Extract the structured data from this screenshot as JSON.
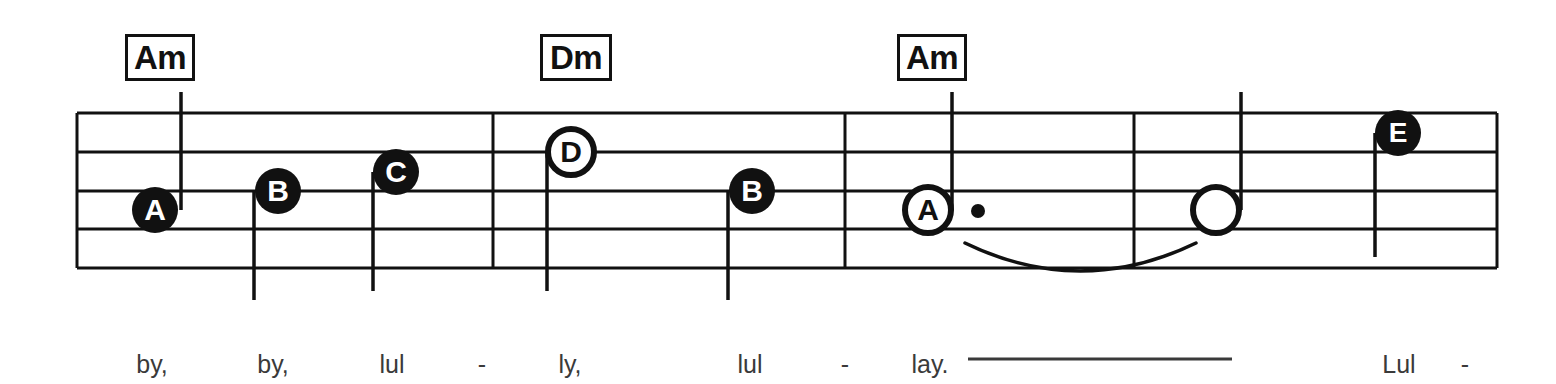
{
  "document": {
    "kind": "sheet-music-staff-line",
    "title": "Lullaby staff system with chord symbols and lyrics"
  },
  "colors": {
    "ink": "#111111",
    "paper": "#ffffff",
    "lyric_text": "#3a3a3a",
    "notehead_fill": "#111111",
    "notehead_hollow": "#ffffff"
  },
  "staff": {
    "x_start": 77,
    "x_end": 1497,
    "line_ys": [
      113,
      152,
      191,
      229,
      268
    ],
    "line_width": 3,
    "barline_xs": [
      493,
      845,
      1134
    ]
  },
  "chords": [
    {
      "label": "Am",
      "x": 160,
      "y": 34,
      "width": 70,
      "height": 47
    },
    {
      "label": "Dm",
      "x": 576,
      "y": 34,
      "width": 72,
      "height": 47
    },
    {
      "label": "Am",
      "x": 932,
      "y": 34,
      "width": 70,
      "height": 47
    }
  ],
  "notes": [
    {
      "letter": "A",
      "x": 155,
      "y": 210,
      "head": "filled",
      "stem": "up",
      "stem_x": 181,
      "stem_y2": 92,
      "dotted": false,
      "radius": 23,
      "font_size": 30
    },
    {
      "letter": "B",
      "x": 278,
      "y": 191,
      "head": "filled",
      "stem": "down",
      "stem_x": 254,
      "stem_y2": 300,
      "dotted": false,
      "radius": 23,
      "font_size": 30
    },
    {
      "letter": "C",
      "x": 396,
      "y": 172,
      "head": "filled",
      "stem": "down",
      "stem_x": 373,
      "stem_y2": 291,
      "dotted": false,
      "radius": 23,
      "font_size": 30
    },
    {
      "letter": "D",
      "x": 571,
      "y": 152,
      "head": "hollow",
      "stem": "down",
      "stem_x": 547,
      "stem_y2": 291,
      "dotted": false,
      "radius": 23,
      "font_size": 30
    },
    {
      "letter": "B",
      "x": 752,
      "y": 191,
      "head": "filled",
      "stem": "down",
      "stem_x": 728,
      "stem_y2": 300,
      "dotted": false,
      "radius": 23,
      "font_size": 30
    },
    {
      "letter": "A",
      "x": 928,
      "y": 210,
      "head": "hollow",
      "stem": "up",
      "stem_x": 952,
      "stem_y2": 92,
      "dotted": true,
      "radius": 23,
      "font_size": 30
    },
    {
      "letter": "",
      "x": 1216,
      "y": 210,
      "head": "hollow",
      "stem": "up",
      "stem_x": 1241,
      "stem_y2": 92,
      "dotted": false,
      "radius": 23,
      "font_size": 30
    },
    {
      "letter": "E",
      "x": 1398,
      "y": 133,
      "head": "filled",
      "stem": "down",
      "stem_x": 1375,
      "stem_y2": 257,
      "dotted": false,
      "radius": 23,
      "font_size": 28
    }
  ],
  "augmentation_dot": {
    "x": 978,
    "y": 211,
    "radius": 7
  },
  "tie": {
    "x_start": 965,
    "x_end": 1196,
    "y_start": 243,
    "sag": 28
  },
  "lyrics": [
    {
      "text": "by,",
      "x": 152,
      "y": 350
    },
    {
      "text": "by,",
      "x": 273,
      "y": 350
    },
    {
      "text": "lul",
      "x": 392,
      "y": 350
    },
    {
      "text": "-",
      "x": 482,
      "y": 350
    },
    {
      "text": "ly,",
      "x": 570,
      "y": 350
    },
    {
      "text": "lul",
      "x": 750,
      "y": 350
    },
    {
      "text": "-",
      "x": 845,
      "y": 350
    },
    {
      "text": "lay.",
      "x": 930,
      "y": 350
    },
    {
      "text": "Lul",
      "x": 1399,
      "y": 350
    },
    {
      "text": "-",
      "x": 1465,
      "y": 350
    }
  ],
  "lyric_extender": {
    "x_start": 968,
    "x_end": 1232,
    "y": 359
  }
}
